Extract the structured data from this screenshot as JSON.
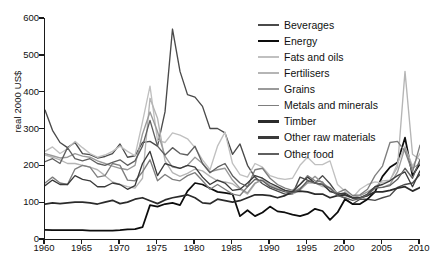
{
  "chart_data": {
    "type": "line",
    "title": "",
    "subtitle": "",
    "xlabel": "",
    "ylabel": "real 2000 US$",
    "xlim": [
      1960,
      2010
    ],
    "ylim": [
      0,
      600
    ],
    "grid": false,
    "legend_position": "top-right",
    "xticks": [
      1960,
      1965,
      1970,
      1975,
      1980,
      1985,
      1990,
      1995,
      2000,
      2005,
      2010
    ],
    "yticks": [
      0,
      100,
      200,
      300,
      400,
      500,
      600
    ],
    "x": [
      1960,
      1961,
      1962,
      1963,
      1964,
      1965,
      1966,
      1967,
      1968,
      1969,
      1970,
      1971,
      1972,
      1973,
      1974,
      1975,
      1976,
      1977,
      1978,
      1979,
      1980,
      1981,
      1982,
      1983,
      1984,
      1985,
      1986,
      1987,
      1988,
      1989,
      1990,
      1991,
      1992,
      1993,
      1994,
      1995,
      1996,
      1997,
      1998,
      1999,
      2000,
      2001,
      2002,
      2003,
      2004,
      2005,
      2006,
      2007,
      2008,
      2009,
      2010
    ],
    "series": [
      {
        "name": "Beverages",
        "color": "#4a4a4a",
        "values": [
          350,
          295,
          262,
          248,
          262,
          232,
          229,
          220,
          224,
          232,
          258,
          222,
          226,
          262,
          265,
          252,
          345,
          570,
          455,
          392,
          385,
          360,
          300,
          300,
          288,
          230,
          258,
          200,
          168,
          150,
          138,
          130,
          122,
          122,
          168,
          160,
          152,
          172,
          150,
          122,
          110,
          95,
          108,
          108,
          105,
          112,
          118,
          140,
          148,
          152,
          175
        ]
      },
      {
        "name": "Energy",
        "color": "#0d0d0d",
        "values": [
          25,
          24,
          24,
          24,
          24,
          24,
          23,
          23,
          23,
          23,
          24,
          26,
          27,
          32,
          92,
          88,
          95,
          98,
          92,
          130,
          152,
          148,
          138,
          128,
          125,
          122,
          62,
          78,
          62,
          72,
          88,
          75,
          72,
          66,
          62,
          68,
          82,
          76,
          52,
          72,
          108,
          95,
          95,
          108,
          128,
          170,
          195,
          208,
          275,
          172,
          205
        ]
      },
      {
        "name": "Fats and oils",
        "color": "#c0c0c0",
        "values": [
          238,
          250,
          232,
          245,
          265,
          248,
          232,
          222,
          228,
          238,
          252,
          238,
          226,
          318,
          415,
          268,
          262,
          288,
          282,
          272,
          248,
          215,
          188,
          252,
          290,
          205,
          175,
          168,
          205,
          195,
          172,
          165,
          162,
          165,
          200,
          222,
          202,
          202,
          212,
          148,
          130,
          112,
          135,
          148,
          155,
          152,
          158,
          205,
          252,
          198,
          232
        ]
      },
      {
        "name": "Fertilisers",
        "color": "#b5b5b5",
        "values": [
          228,
          222,
          215,
          205,
          205,
          200,
          195,
          188,
          172,
          155,
          148,
          142,
          138,
          165,
          382,
          328,
          212,
          180,
          170,
          178,
          190,
          185,
          170,
          158,
          155,
          150,
          135,
          122,
          150,
          165,
          148,
          138,
          132,
          122,
          132,
          152,
          152,
          142,
          140,
          125,
          118,
          112,
          110,
          118,
          142,
          158,
          160,
          195,
          455,
          230,
          215
        ]
      },
      {
        "name": "Grains",
        "color": "#9a9a9a",
        "values": [
          232,
          226,
          220,
          222,
          232,
          225,
          222,
          212,
          205,
          198,
          192,
          188,
          200,
          285,
          345,
          292,
          225,
          195,
          192,
          200,
          222,
          205,
          182,
          188,
          192,
          160,
          138,
          125,
          152,
          160,
          145,
          135,
          132,
          128,
          138,
          152,
          170,
          152,
          138,
          125,
          118,
          112,
          118,
          128,
          140,
          140,
          148,
          182,
          248,
          192,
          205
        ]
      },
      {
        "name": "Metals and minerals",
        "color": "#7e7e7e",
        "values": [
          152,
          168,
          152,
          148,
          190,
          200,
          195,
          168,
          172,
          205,
          200,
          160,
          158,
          182,
          215,
          158,
          175,
          162,
          158,
          172,
          180,
          158,
          135,
          148,
          135,
          122,
          118,
          142,
          188,
          192,
          165,
          148,
          138,
          132,
          148,
          172,
          158,
          155,
          128,
          125,
          135,
          118,
          120,
          135,
          172,
          198,
          262,
          265,
          238,
          182,
          255
        ]
      },
      {
        "name": "Timber",
        "color": "#2b2b2b",
        "values": [
          95,
          98,
          96,
          98,
          100,
          100,
          98,
          95,
          100,
          105,
          96,
          100,
          108,
          112,
          104,
          96,
          106,
          112,
          116,
          120,
          112,
          98,
          96,
          108,
          104,
          100,
          104,
          112,
          120,
          120,
          118,
          112,
          118,
          128,
          130,
          128,
          122,
          122,
          112,
          118,
          120,
          112,
          112,
          118,
          128,
          128,
          132,
          138,
          142,
          130,
          140
        ]
      },
      {
        "name": "Other raw materials",
        "color": "#3a3a3a",
        "values": [
          145,
          160,
          148,
          148,
          172,
          162,
          158,
          142,
          142,
          152,
          148,
          135,
          145,
          205,
          238,
          172,
          205,
          198,
          192,
          200,
          195,
          168,
          148,
          160,
          152,
          132,
          135,
          152,
          172,
          165,
          152,
          142,
          132,
          128,
          148,
          168,
          152,
          148,
          130,
          122,
          125,
          112,
          112,
          122,
          142,
          148,
          158,
          172,
          182,
          142,
          185
        ]
      },
      {
        "name": "Other food",
        "color": "#5f5f5f",
        "values": [
          210,
          218,
          205,
          248,
          218,
          212,
          218,
          205,
          200,
          208,
          215,
          200,
          212,
          252,
          322,
          252,
          228,
          248,
          232,
          228,
          252,
          205,
          180,
          195,
          205,
          172,
          152,
          142,
          162,
          158,
          142,
          135,
          128,
          125,
          135,
          158,
          152,
          148,
          138,
          118,
          112,
          105,
          110,
          120,
          138,
          140,
          145,
          162,
          192,
          165,
          215
        ]
      }
    ]
  },
  "axes": {
    "ylabel": "real 2000 US$",
    "yticklabels": [
      "600",
      "500",
      "400",
      "300",
      "200",
      "100",
      "0"
    ],
    "xticklabels": [
      "1960",
      "1965",
      "1970",
      "1975",
      "1980",
      "1985",
      "1990",
      "1995",
      "2000",
      "2005",
      "2010"
    ]
  },
  "legend": {
    "items": [
      {
        "label": "Beverages",
        "color": "#4a4a4a"
      },
      {
        "label": "Energy",
        "color": "#0d0d0d"
      },
      {
        "label": "Fats and oils",
        "color": "#c0c0c0"
      },
      {
        "label": "Fertilisers",
        "color": "#b5b5b5"
      },
      {
        "label": "Grains",
        "color": "#9a9a9a"
      },
      {
        "label": "Metals and minerals",
        "color": "#7e7e7e"
      },
      {
        "label": "Timber",
        "color": "#2b2b2b"
      },
      {
        "label": "Other raw materials",
        "color": "#3a3a3a"
      },
      {
        "label": "Other food",
        "color": "#5f5f5f"
      }
    ]
  }
}
